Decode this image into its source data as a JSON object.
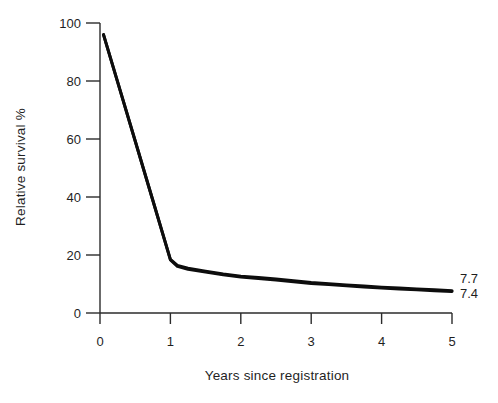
{
  "figure": {
    "background": "#ffffff",
    "ink_color": "#1f1f1f",
    "curve_color": "#0d0d0d",
    "axis_color": "#2b2b2b"
  },
  "chart_data": {
    "type": "line",
    "title": "",
    "xlabel": "Years since registration",
    "ylabel": "Relative survival %",
    "xlim": [
      0,
      5
    ],
    "ylim": [
      0,
      100
    ],
    "x_ticks": [
      "0",
      "1",
      "2",
      "3",
      "4",
      "5"
    ],
    "y_ticks": [
      "0",
      "20",
      "40",
      "60",
      "80",
      "100"
    ],
    "grid": false,
    "legend_position": "none",
    "end_labels": [
      "7.7",
      "7.4"
    ],
    "series": [
      {
        "name": "relative-survival-curve-ending-7.7",
        "x": [
          0.05,
          0.25,
          0.5,
          0.75,
          1.0,
          1.1,
          1.25,
          1.5,
          1.75,
          2.0,
          2.25,
          2.5,
          2.75,
          3.0,
          3.25,
          3.5,
          3.75,
          4.0,
          4.25,
          4.5,
          4.75,
          5.0
        ],
        "values": [
          96,
          79.7,
          59.3,
          38.9,
          18.5,
          16.4,
          15.4,
          14.4,
          13.5,
          12.7,
          12.2,
          11.7,
          11.1,
          10.5,
          10.1,
          9.7,
          9.3,
          8.9,
          8.6,
          8.3,
          8.0,
          7.7
        ]
      },
      {
        "name": "relative-survival-curve-ending-7.4",
        "x": [
          0.05,
          0.25,
          0.5,
          0.75,
          1.0,
          1.1,
          1.25,
          1.5,
          1.75,
          2.0,
          2.25,
          2.5,
          2.75,
          3.0,
          3.25,
          3.5,
          3.75,
          4.0,
          4.25,
          4.5,
          4.75,
          5.0
        ],
        "values": [
          96,
          79.7,
          59.3,
          38.9,
          18.3,
          16.1,
          15.1,
          14.1,
          13.2,
          12.4,
          11.9,
          11.4,
          10.8,
          10.2,
          9.8,
          9.4,
          9.0,
          8.6,
          8.3,
          8.0,
          7.7,
          7.4
        ]
      }
    ]
  }
}
